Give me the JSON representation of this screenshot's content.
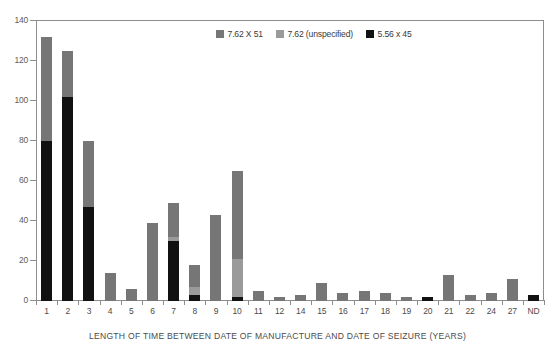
{
  "chart_data": {
    "type": "bar",
    "stacked": true,
    "title": "",
    "xlabel": "LENGTH OF TIME BETWEEN DATE OF MANUFACTURE AND DATE OF SEIZURE (YEARS)",
    "ylabel": "",
    "ylim": [
      0,
      140
    ],
    "yticks": [
      0,
      20,
      40,
      60,
      80,
      100,
      120,
      140
    ],
    "grid": false,
    "legend_position": "top-center",
    "categories": [
      "1",
      "2",
      "3",
      "4",
      "5",
      "6",
      "7",
      "8",
      "9",
      "10",
      "11",
      "12",
      "14",
      "15",
      "16",
      "17",
      "18",
      "19",
      "20",
      "21",
      "22",
      "24",
      "27",
      "ND"
    ],
    "series": [
      {
        "name": "5.56 x 45",
        "color": "#111111",
        "values": [
          80,
          102,
          47,
          0,
          0,
          0,
          30,
          3,
          0,
          2,
          0,
          0,
          0,
          0,
          0,
          0,
          0,
          0,
          2,
          0,
          0,
          0,
          0,
          3
        ]
      },
      {
        "name": "7.62 (unspecified)",
        "color": "#9a9a9a",
        "values": [
          0,
          0,
          0,
          0,
          0,
          0,
          2,
          4,
          0,
          19,
          0,
          0,
          0,
          0,
          0,
          0,
          0,
          0,
          0,
          0,
          0,
          0,
          0,
          0
        ]
      },
      {
        "name": "7.62 X 51",
        "color": "#767676",
        "values": [
          52,
          23,
          33,
          14,
          6,
          39,
          17,
          11,
          43,
          44,
          5,
          2,
          3,
          9,
          4,
          5,
          4,
          2,
          0,
          13,
          3,
          4,
          11,
          0
        ]
      }
    ],
    "totals": [
      132,
      125,
      80,
      14,
      6,
      39,
      49,
      18,
      43,
      65,
      5,
      2,
      3,
      9,
      4,
      5,
      4,
      2,
      2,
      13,
      3,
      4,
      11,
      3
    ]
  },
  "legend": {
    "items": [
      {
        "label": "7.62 X 51",
        "color": "#767676"
      },
      {
        "label": "7.62 (unspecified)",
        "color": "#9a9a9a"
      },
      {
        "label": "5.56 x 45",
        "color": "#111111"
      }
    ]
  },
  "axis": {
    "y_labels": [
      "140",
      "120",
      "100",
      "80",
      "60",
      "40",
      "20",
      "0"
    ],
    "caption": "LENGTH OF TIME BETWEEN DATE OF MANUFACTURE AND DATE OF SEIZURE (YEARS)"
  },
  "colors": {
    "axis": "#8d8d8d",
    "text": "#4b4b4b",
    "background": "#ffffff"
  }
}
